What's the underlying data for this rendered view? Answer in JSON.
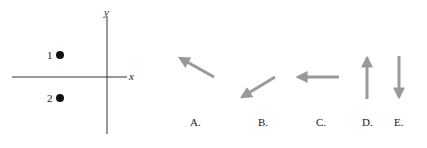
{
  "axes": {
    "x_label": "x",
    "y_label": "y",
    "axis_color": "#333333"
  },
  "points": [
    {
      "label": "1",
      "position": "above x-axis, left of y-axis"
    },
    {
      "label": "2",
      "position": "below x-axis, left of y-axis"
    }
  ],
  "arrow_color": "#999999",
  "options": [
    {
      "label": "A.",
      "direction": "up-left"
    },
    {
      "label": "B.",
      "direction": "down-left"
    },
    {
      "label": "C.",
      "direction": "left"
    },
    {
      "label": "D.",
      "direction": "up"
    },
    {
      "label": "E.",
      "direction": "down"
    }
  ]
}
